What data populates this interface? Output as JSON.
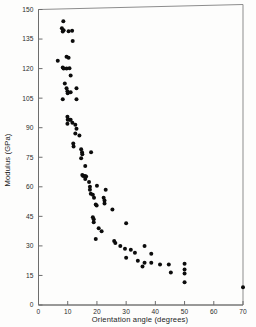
{
  "chart_data": {
    "type": "scatter",
    "title": "",
    "xlabel": "Orientation angle (degrees)",
    "ylabel": "Modulus (GPa)",
    "xlim": [
      0,
      70
    ],
    "ylim": [
      0,
      150
    ],
    "xticks": [
      0,
      10,
      20,
      30,
      40,
      50,
      60,
      70
    ],
    "yticks": [
      0,
      15,
      30,
      45,
      60,
      75,
      90,
      105,
      120,
      135,
      150
    ],
    "xtick_labels": [
      "0",
      "10",
      "20",
      "30",
      "40",
      "50",
      "60",
      "70"
    ],
    "ytick_labels": [
      "0",
      "15",
      "30",
      "45",
      "60",
      "75",
      "90",
      "105",
      "120",
      "135",
      "150"
    ],
    "grid": false,
    "legend": null,
    "marker": "filled-circle",
    "marker_color": "#0c0c0c",
    "frame": "box",
    "points": [
      [
        8.5,
        144.0
      ],
      [
        8.0,
        140.5
      ],
      [
        8.6,
        139.5
      ],
      [
        8.3,
        138.8
      ],
      [
        10.3,
        139.0
      ],
      [
        11.5,
        139.2
      ],
      [
        11.7,
        134.0
      ],
      [
        6.6,
        124.0
      ],
      [
        9.6,
        126.0
      ],
      [
        10.3,
        125.5
      ],
      [
        8.3,
        120.5
      ],
      [
        8.6,
        120.0
      ],
      [
        9.6,
        120.0
      ],
      [
        10.6,
        120.2
      ],
      [
        11.0,
        116.5
      ],
      [
        9.0,
        112.5
      ],
      [
        9.6,
        110.0
      ],
      [
        9.9,
        108.5
      ],
      [
        10.0,
        107.5
      ],
      [
        11.0,
        108.0
      ],
      [
        13.0,
        110.0
      ],
      [
        8.3,
        104.5
      ],
      [
        13.0,
        104.5
      ],
      [
        9.9,
        95.5
      ],
      [
        10.0,
        94.0
      ],
      [
        10.6,
        94.0
      ],
      [
        11.0,
        94.0
      ],
      [
        9.9,
        92.0
      ],
      [
        11.6,
        92.5
      ],
      [
        12.6,
        91.5
      ],
      [
        13.0,
        89.5
      ],
      [
        12.6,
        87.0
      ],
      [
        14.0,
        86.0
      ],
      [
        11.9,
        82.0
      ],
      [
        12.0,
        80.5
      ],
      [
        14.6,
        79.0
      ],
      [
        14.9,
        77.5
      ],
      [
        15.0,
        76.5
      ],
      [
        14.6,
        74.5
      ],
      [
        18.0,
        77.5
      ],
      [
        16.0,
        70.5
      ],
      [
        15.0,
        66.0
      ],
      [
        15.3,
        65.5
      ],
      [
        15.9,
        65.5
      ],
      [
        16.3,
        65.2
      ],
      [
        16.0,
        64.0
      ],
      [
        17.3,
        62.5
      ],
      [
        17.6,
        60.0
      ],
      [
        17.6,
        58.5
      ],
      [
        20.0,
        60.5
      ],
      [
        17.9,
        56.5
      ],
      [
        18.6,
        56.0
      ],
      [
        23.0,
        58.5
      ],
      [
        19.0,
        54.5
      ],
      [
        22.3,
        54.5
      ],
      [
        22.6,
        53.0
      ],
      [
        22.6,
        51.5
      ],
      [
        19.6,
        51.0
      ],
      [
        19.9,
        50.5
      ],
      [
        25.3,
        48.5
      ],
      [
        18.6,
        44.5
      ],
      [
        18.9,
        43.5
      ],
      [
        18.9,
        42.0
      ],
      [
        30.0,
        41.5
      ],
      [
        20.6,
        39.0
      ],
      [
        21.6,
        37.5
      ],
      [
        19.6,
        33.5
      ],
      [
        25.9,
        32.5
      ],
      [
        26.3,
        31.5
      ],
      [
        28.0,
        30.0
      ],
      [
        36.3,
        30.0
      ],
      [
        29.6,
        28.5
      ],
      [
        31.6,
        28.0
      ],
      [
        33.0,
        26.5
      ],
      [
        38.6,
        26.0
      ],
      [
        30.0,
        24.0
      ],
      [
        34.0,
        22.5
      ],
      [
        36.3,
        21.5
      ],
      [
        38.6,
        21.5
      ],
      [
        41.6,
        20.5
      ],
      [
        44.6,
        20.5
      ],
      [
        50.0,
        21.0
      ],
      [
        35.6,
        19.5
      ],
      [
        50.0,
        18.0
      ],
      [
        50.0,
        16.0
      ],
      [
        45.3,
        16.5
      ],
      [
        50.0,
        11.5
      ],
      [
        70.0,
        9.0
      ]
    ]
  },
  "axes": {
    "x_title": "Orientation angle (degrees)",
    "y_title": "Modulus (GPa)"
  }
}
